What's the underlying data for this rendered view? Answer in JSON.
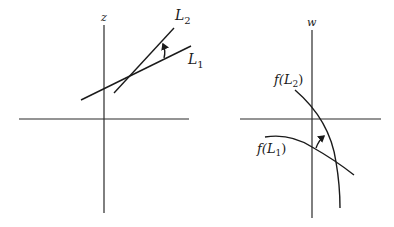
{
  "left_panel": {
    "axis_label": "z",
    "lines": [
      {
        "name": "L",
        "sub": "1"
      },
      {
        "name": "L",
        "sub": "2"
      }
    ]
  },
  "right_panel": {
    "axis_label": "w",
    "curves": [
      {
        "prefix": "f(",
        "name": "L",
        "sub": "2",
        "suffix": ")"
      },
      {
        "prefix": "f(",
        "name": "L",
        "sub": "1",
        "suffix": ")"
      }
    ]
  },
  "colors": {
    "stroke": "#1a1a1a",
    "background": "#ffffff"
  }
}
